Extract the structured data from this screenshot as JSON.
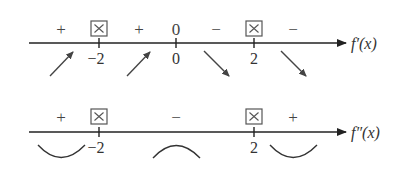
{
  "diagram": {
    "type": "sign-chart",
    "colors": {
      "line": "#222222",
      "text": "#333333",
      "box": "#555555"
    },
    "first_derivative": {
      "label": "f′(x)",
      "critical_points": [
        "−2",
        "0",
        "2"
      ],
      "signs": [
        "+",
        "⊠",
        "+",
        "0",
        "−",
        "⊠",
        "−"
      ],
      "behavior": [
        "increasing-arrow",
        "increasing-arrow",
        "decreasing-arrow",
        "decreasing-arrow"
      ]
    },
    "second_derivative": {
      "label": "f″(x)",
      "critical_points": [
        "−2",
        "2"
      ],
      "signs": [
        "+",
        "⊠",
        "−",
        "⊠",
        "+"
      ],
      "concavity": [
        "concave-up",
        "concave-down",
        "concave-up"
      ]
    }
  }
}
